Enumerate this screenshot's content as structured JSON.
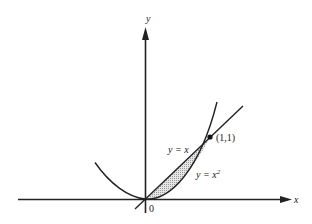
{
  "figure": {
    "axes": {
      "x_label": "x",
      "y_label": "y",
      "origin_label": "0"
    },
    "curves": [
      {
        "name": "line",
        "label": "y = x",
        "equation": "y = x"
      },
      {
        "name": "parabola",
        "label": "y = x",
        "label_sup": "2",
        "equation": "y = x^2"
      }
    ],
    "points": [
      {
        "label": "(1,1)",
        "x": 1,
        "y": 1
      }
    ],
    "shaded_region": "area between y = x and y = x^2 for 0 ≤ x ≤ 1",
    "colors": {
      "ink": "#222222",
      "shade": "#bdbdbd",
      "background": "#ffffff"
    }
  }
}
